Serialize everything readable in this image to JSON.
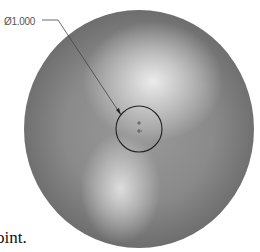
{
  "diagram": {
    "dimension_label": "Ø1.000",
    "caption_fragment": "oint.",
    "sphere": {
      "center": [
        139,
        129
      ],
      "rx": 115,
      "ry": 119,
      "base_color": "#8a8a8a",
      "edge_color": "#3e3e3e"
    },
    "hole": {
      "center": [
        139,
        129
      ],
      "r": 23,
      "stroke": "#222222"
    },
    "leader": {
      "from": [
        42,
        20
      ],
      "elbow": [
        58,
        20
      ],
      "to": [
        121,
        115
      ]
    }
  }
}
